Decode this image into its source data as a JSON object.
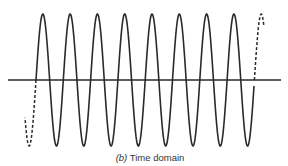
{
  "figure": {
    "caption_label": "(b)",
    "caption_text": " Time domain",
    "line_color": "#2a2a2a",
    "axis": {
      "x_start": 8,
      "x_end": 281,
      "y": 80
    },
    "wave": {
      "amplitude": 66,
      "period": 27.3,
      "solid_start_x": 36,
      "solid_cycles": 8,
      "dashed_lead_end_x": 25,
      "dashed_trail_end_x": 264
    }
  }
}
